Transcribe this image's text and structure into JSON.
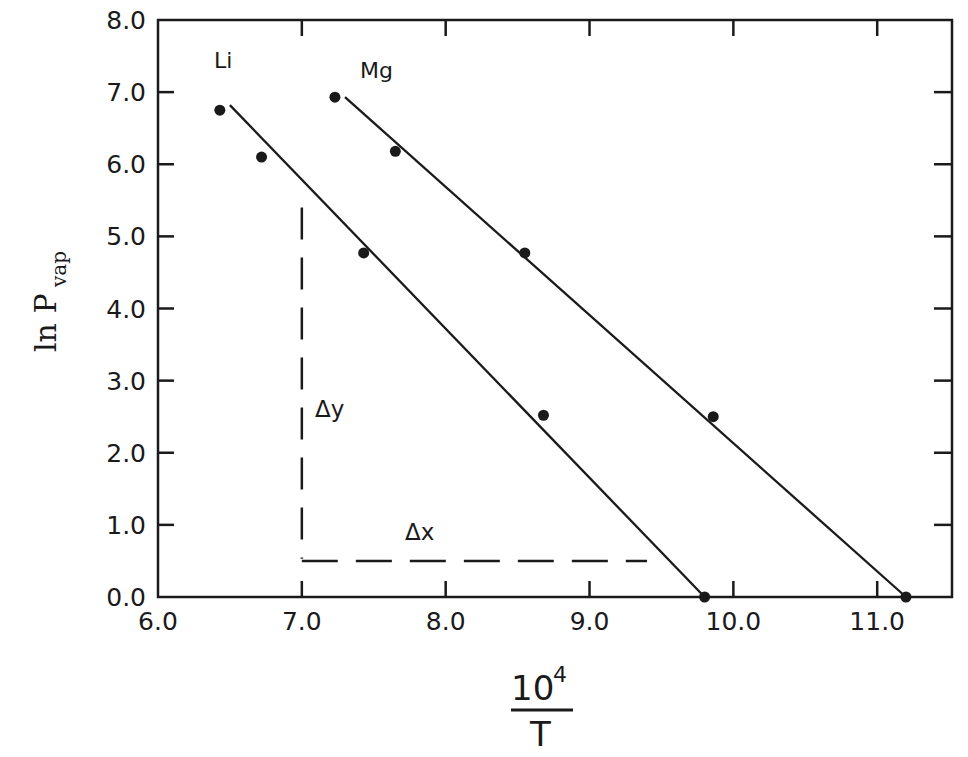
{
  "chart_data": {
    "type": "line",
    "title": "",
    "xlabel": "10^4 / T",
    "ylabel": "ln P_vap",
    "xlim": [
      6.0,
      11.52
    ],
    "ylim": [
      0.0,
      8.0
    ],
    "grid": false,
    "legend": "none (series labeled inline)",
    "x_ticks": [
      "6.0",
      "7.0",
      "8.0",
      "9.0",
      "10.0",
      "11.0"
    ],
    "y_ticks": [
      "0.0",
      "1.0",
      "2.0",
      "3.0",
      "4.0",
      "5.0",
      "6.0",
      "7.0",
      "8.0"
    ],
    "series": [
      {
        "name": "Li",
        "points": [
          {
            "x": 6.43,
            "y": 6.75
          },
          {
            "x": 6.72,
            "y": 6.1
          },
          {
            "x": 7.43,
            "y": 4.77
          },
          {
            "x": 8.68,
            "y": 2.52
          },
          {
            "x": 9.8,
            "y": 0.0
          }
        ],
        "fit_line": [
          {
            "x": 6.5,
            "y": 6.82
          },
          {
            "x": 9.8,
            "y": 0.0
          }
        ]
      },
      {
        "name": "Mg",
        "points": [
          {
            "x": 7.23,
            "y": 6.93
          },
          {
            "x": 7.65,
            "y": 6.18
          },
          {
            "x": 8.55,
            "y": 4.77
          },
          {
            "x": 9.86,
            "y": 2.5
          },
          {
            "x": 11.2,
            "y": 0.0
          }
        ],
        "fit_line": [
          {
            "x": 7.3,
            "y": 6.93
          },
          {
            "x": 11.2,
            "y": 0.0
          }
        ]
      }
    ],
    "annotations": [
      {
        "text": "Δy",
        "type": "vertical-dashed",
        "x": 7.0,
        "y_from": 0.53,
        "y_to": 5.4
      },
      {
        "text": "Δx",
        "type": "horizontal-dashed",
        "y": 0.5,
        "x_from": 7.0,
        "x_to": 9.4
      }
    ]
  },
  "labels": {
    "ylabel_main": "ln P",
    "ylabel_sub": "vap",
    "xlabel_num": "10",
    "xlabel_sup": "4",
    "xlabel_den": "T",
    "series_li": "Li",
    "series_mg": "Mg",
    "delta_y": "Δy",
    "delta_x": "Δx"
  },
  "colors": {
    "ink": "#1a1a1a",
    "background": "#ffffff"
  }
}
